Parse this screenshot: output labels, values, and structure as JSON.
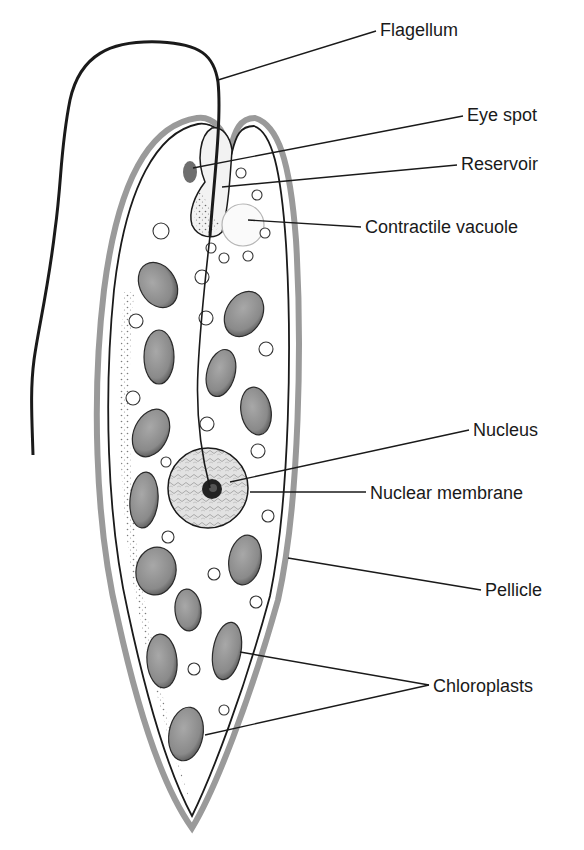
{
  "diagram": {
    "colors": {
      "ink": "#1a1a1a",
      "pellicle": "#9a9a9a",
      "chloroplast": "#8a8a8a",
      "nucleus": "#d9d9d9",
      "eyespot": "#6e6e6e",
      "background": "#ffffff"
    },
    "labels": [
      {
        "id": "flagellum",
        "text": "Flagellum",
        "x": 380,
        "y": 21,
        "line": [
          [
            376,
            31
          ],
          [
            218,
            80
          ]
        ]
      },
      {
        "id": "eye-spot",
        "text": "Eye spot",
        "x": 467,
        "y": 106,
        "line": [
          [
            463,
            116
          ],
          [
            193,
            168
          ]
        ]
      },
      {
        "id": "reservoir",
        "text": "Reservoir",
        "x": 461,
        "y": 155,
        "line": [
          [
            457,
            165
          ],
          [
            222,
            187
          ]
        ]
      },
      {
        "id": "contractile-vacuole",
        "text": "Contractile vacuole",
        "x": 365,
        "y": 218,
        "line": [
          [
            361,
            227
          ],
          [
            248,
            220
          ]
        ]
      },
      {
        "id": "nucleus",
        "text": "Nucleus",
        "x": 473,
        "y": 421,
        "line": [
          [
            469,
            430
          ],
          [
            230,
            482
          ]
        ]
      },
      {
        "id": "nuclear-membrane",
        "text": "Nuclear membrane",
        "x": 370,
        "y": 484,
        "line": [
          [
            366,
            492
          ],
          [
            250,
            492
          ]
        ]
      },
      {
        "id": "pellicle",
        "text": "Pellicle",
        "x": 485,
        "y": 581,
        "line": [
          [
            481,
            590
          ],
          [
            288,
            558
          ]
        ]
      },
      {
        "id": "chloroplasts",
        "text": "Chloroplasts",
        "x": 433,
        "y": 677,
        "lines": [
          [
            [
              429,
              685
            ],
            [
              240,
              652
            ]
          ],
          [
            [
              429,
              685
            ],
            [
              205,
              735
            ]
          ]
        ]
      }
    ],
    "chloroplasts": [
      {
        "cx": 158,
        "cy": 285,
        "rx": 18,
        "ry": 24,
        "rot": -30
      },
      {
        "cx": 244,
        "cy": 314,
        "rx": 18,
        "ry": 24,
        "rot": 30
      },
      {
        "cx": 159,
        "cy": 357,
        "rx": 15,
        "ry": 27,
        "rot": 0
      },
      {
        "cx": 221,
        "cy": 373,
        "rx": 14,
        "ry": 24,
        "rot": 15
      },
      {
        "cx": 256,
        "cy": 411,
        "rx": 15,
        "ry": 24,
        "rot": -10
      },
      {
        "cx": 151,
        "cy": 433,
        "rx": 17,
        "ry": 25,
        "rot": 25
      },
      {
        "cx": 144,
        "cy": 500,
        "rx": 14,
        "ry": 28,
        "rot": 5
      },
      {
        "cx": 156,
        "cy": 571,
        "rx": 20,
        "ry": 24,
        "rot": 10
      },
      {
        "cx": 245,
        "cy": 560,
        "rx": 16,
        "ry": 25,
        "rot": 10
      },
      {
        "cx": 188,
        "cy": 610,
        "rx": 13,
        "ry": 21,
        "rot": -5
      },
      {
        "cx": 162,
        "cy": 661,
        "rx": 15,
        "ry": 27,
        "rot": -5
      },
      {
        "cx": 227,
        "cy": 651,
        "rx": 14,
        "ry": 29,
        "rot": 10
      },
      {
        "cx": 186,
        "cy": 734,
        "rx": 17,
        "ry": 27,
        "rot": 10
      }
    ],
    "granules": [
      {
        "cx": 161,
        "cy": 231,
        "r": 8
      },
      {
        "cx": 241,
        "cy": 173,
        "r": 5
      },
      {
        "cx": 257,
        "cy": 195,
        "r": 5
      },
      {
        "cx": 265,
        "cy": 233,
        "r": 5
      },
      {
        "cx": 211,
        "cy": 248,
        "r": 5
      },
      {
        "cx": 224,
        "cy": 258,
        "r": 5
      },
      {
        "cx": 248,
        "cy": 256,
        "r": 5
      },
      {
        "cx": 202,
        "cy": 277,
        "r": 7
      },
      {
        "cx": 136,
        "cy": 321,
        "r": 7
      },
      {
        "cx": 206,
        "cy": 318,
        "r": 7
      },
      {
        "cx": 266,
        "cy": 349,
        "r": 7
      },
      {
        "cx": 133,
        "cy": 398,
        "r": 7
      },
      {
        "cx": 207,
        "cy": 424,
        "r": 7
      },
      {
        "cx": 258,
        "cy": 451,
        "r": 7
      },
      {
        "cx": 166,
        "cy": 462,
        "r": 5
      },
      {
        "cx": 268,
        "cy": 516,
        "r": 6
      },
      {
        "cx": 168,
        "cy": 537,
        "r": 6
      },
      {
        "cx": 214,
        "cy": 574,
        "r": 6
      },
      {
        "cx": 256,
        "cy": 602,
        "r": 6
      },
      {
        "cx": 194,
        "cy": 669,
        "r": 6
      },
      {
        "cx": 224,
        "cy": 710,
        "r": 5
      }
    ]
  }
}
